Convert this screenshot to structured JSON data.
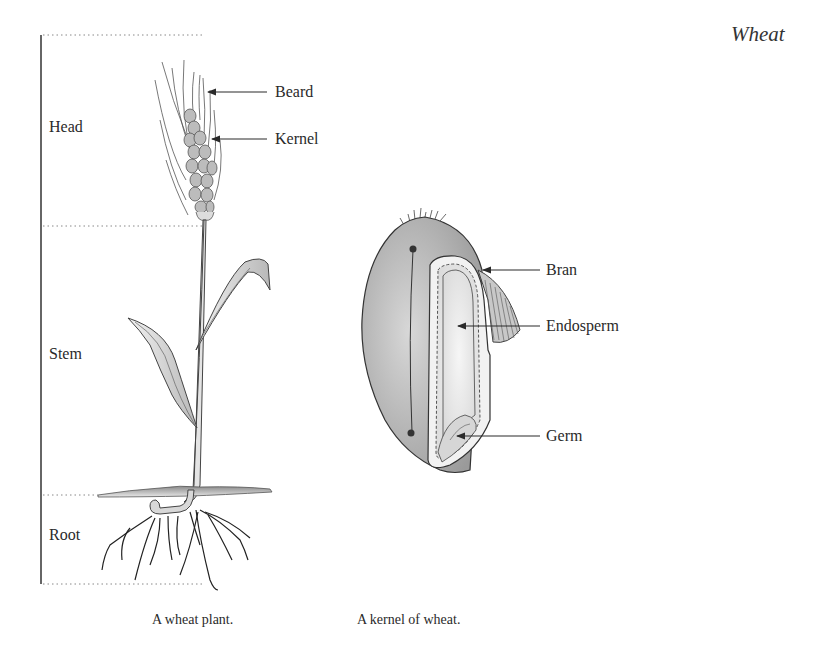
{
  "page": {
    "title": "Wheat"
  },
  "plant": {
    "sections": [
      {
        "label": "Head"
      },
      {
        "label": "Stem"
      },
      {
        "label": "Root"
      }
    ],
    "parts": [
      {
        "label": "Beard"
      },
      {
        "label": "Kernel"
      }
    ],
    "caption": "A wheat plant."
  },
  "kernel": {
    "parts": [
      {
        "label": "Bran"
      },
      {
        "label": "Endosperm"
      },
      {
        "label": "Germ"
      }
    ],
    "caption": "A kernel of wheat."
  }
}
